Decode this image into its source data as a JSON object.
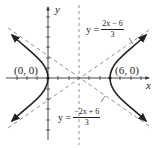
{
  "diagram": {
    "type": "hyperbola-graph",
    "colors": {
      "curve": "#222222",
      "axes": "#333333",
      "asymptote": "#666666",
      "text": "#222222"
    },
    "axes": {
      "x_label": "x",
      "y_label": "y"
    },
    "vertices": [
      {
        "label": "(0, 0)",
        "x": 0,
        "y": 0
      },
      {
        "label": "(6, 0)",
        "x": 6,
        "y": 0
      }
    ],
    "asymptotes": [
      {
        "prefix": "y =",
        "numerator": "2x − 6",
        "denominator": "3"
      },
      {
        "prefix": "y =",
        "numerator": "−2x + 6",
        "denominator": "3"
      }
    ]
  }
}
